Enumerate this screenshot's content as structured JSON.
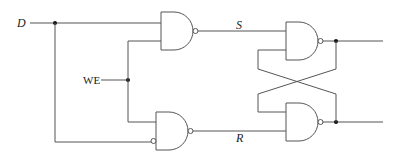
{
  "diagram": {
    "type": "gated D latch (NAND implementation)",
    "labels": {
      "data_input": "D",
      "write_enable": "WE",
      "set_signal": "S",
      "reset_signal": "R"
    },
    "gates": [
      {
        "id": "nand-input-top",
        "kind": "NAND",
        "inputs": [
          "D",
          "WE"
        ],
        "output": "S"
      },
      {
        "id": "nand-input-bottom",
        "kind": "NAND",
        "inputs": [
          "WE",
          "NOT D"
        ],
        "output": "R"
      },
      {
        "id": "nand-latch-top",
        "kind": "NAND",
        "inputs": [
          "S",
          "feedback from bottom latch"
        ],
        "output": "Q"
      },
      {
        "id": "nand-latch-bottom",
        "kind": "NAND",
        "inputs": [
          "feedback from top latch",
          "R"
        ],
        "output": "Q'"
      }
    ],
    "colors": {
      "wire": "#555555",
      "junction": "#111111",
      "background": "#ffffff"
    }
  }
}
